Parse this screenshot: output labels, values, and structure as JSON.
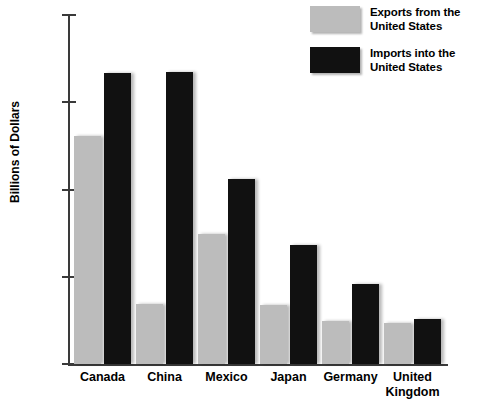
{
  "chart_data": {
    "type": "bar",
    "title": "",
    "xlabel": "",
    "ylabel": "Billions of Dollars",
    "categories": [
      "Canada",
      "China",
      "Mexico",
      "Japan",
      "Germany",
      "United\nKingdom"
    ],
    "series": [
      {
        "name": "Exports from the United States",
        "color": "#bcbcbc",
        "values": [
          261,
          69,
          149,
          68,
          49,
          47
        ]
      },
      {
        "name": "Imports into the United States",
        "color": "#111111",
        "values": [
          333,
          335,
          212,
          136,
          92,
          52
        ]
      }
    ],
    "ylim": [
      0,
      400
    ],
    "ytick_values": [
      400,
      300,
      200,
      100,
      0
    ],
    "ytick_labels": [
      "$400",
      "$300",
      "$200",
      "$100",
      "$0"
    ],
    "grid": false,
    "legend_position": "top-right"
  },
  "legend": {
    "items": [
      {
        "swatch": "gray-swatch",
        "label": "Exports from the\nUnited States"
      },
      {
        "swatch": "black-swatch",
        "label": "Imports into the\nUnited States"
      }
    ]
  }
}
